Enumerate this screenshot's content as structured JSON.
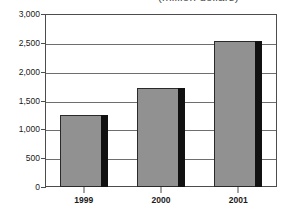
{
  "chart_data": {
    "type": "bar",
    "title": "(million dollars)",
    "xlabel": "",
    "ylabel": "",
    "categories": [
      "1999",
      "2000",
      "2001"
    ],
    "values": [
      1250,
      1720,
      2540
    ],
    "series": [
      {
        "name": "Value",
        "values": [
          1250,
          1720,
          2540
        ]
      }
    ],
    "ylim": [
      0,
      3000
    ],
    "y_ticks": [
      0,
      500,
      1000,
      1500,
      2000,
      2500,
      3000
    ],
    "y_tick_labels": [
      "0",
      "500",
      "1,000",
      "1,500",
      "2,000",
      "2,500",
      "3,000"
    ],
    "grid": true,
    "legend": false,
    "bar_color": "#919191",
    "bar_shadow_color": "#111111",
    "frame_color": "#4d4d4d",
    "gridline_color": "#6e6e6e"
  }
}
